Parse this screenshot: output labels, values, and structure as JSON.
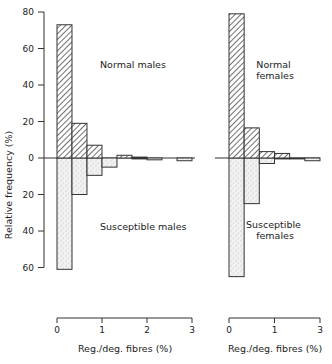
{
  "chart_data": {
    "type": "bar",
    "title": "",
    "ylabel": "Relative frequency (%)",
    "y_ticks_up": [
      0,
      20,
      40,
      60,
      80
    ],
    "y_ticks_down": [
      20,
      40,
      60
    ],
    "ylim": [
      -60,
      80
    ],
    "grid": false,
    "bin_width": 0.333,
    "panels": [
      {
        "name": "males",
        "xlabel": "Reg./deg. fibres (%)",
        "x_ticks": [
          "0",
          "1",
          "2",
          "3"
        ],
        "upper_series": {
          "name": "Normal males",
          "pattern": "hatched",
          "bins": [
            0,
            0.333,
            0.667,
            1.0,
            1.333,
            1.667,
            2.0,
            2.333,
            2.667
          ],
          "values": [
            73,
            19,
            7,
            0,
            1.5,
            0.5,
            0,
            0,
            0
          ]
        },
        "lower_series": {
          "name": "Susceptible males",
          "pattern": "stippled",
          "bins": [
            0,
            0.333,
            0.667,
            1.0,
            1.333,
            1.667,
            2.0,
            2.333,
            2.667
          ],
          "values": [
            61,
            20,
            9.5,
            5,
            0,
            0.5,
            1,
            0,
            1.5
          ]
        }
      },
      {
        "name": "females",
        "xlabel": "Reg./deg. fibres (%)",
        "x_ticks": [
          "0",
          "1",
          "3"
        ],
        "upper_series": {
          "name": "Normal females",
          "pattern": "hatched",
          "bins": [
            0,
            0.333,
            0.667,
            1.0,
            1.333,
            1.667
          ],
          "values": [
            79,
            16.5,
            3.5,
            2.5,
            0,
            0
          ]
        },
        "lower_series": {
          "name": "Susceptible females",
          "pattern": "stippled",
          "bins": [
            0,
            0.333,
            0.667,
            1.0,
            1.333,
            1.667
          ],
          "values": [
            65,
            25,
            3,
            0.5,
            0.5,
            1.5
          ]
        }
      }
    ],
    "annotations": [
      "Normal males",
      "Susceptible males",
      "Normal females",
      "Susceptible females"
    ]
  },
  "labels": {
    "ylabel": "Relative frequency (%)",
    "normal_males": "Normal males",
    "susceptible_males": "Susceptible males",
    "normal_females_1": "Normal",
    "normal_females_2": "females",
    "susceptible_females_1": "Susceptible",
    "susceptible_females_2": "females",
    "xlabel_left": "Reg./deg. fibres (%)",
    "xlabel_right": "Reg./deg. fibres (%)"
  }
}
